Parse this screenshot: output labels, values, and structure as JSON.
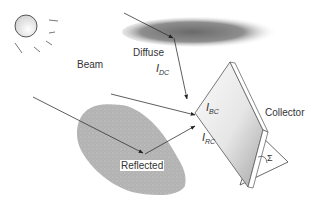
{
  "diagram": {
    "labels": {
      "diffuse": "Diffuse",
      "beam": "Beam",
      "reflected": "Reflected",
      "collector": "Collector",
      "i_dc_main": "I",
      "i_dc_sub": "DC",
      "i_bc_main": "I",
      "i_bc_sub": "BC",
      "i_rc_main": "I",
      "i_rc_sub": "RC",
      "tilt_angle": "Σ"
    },
    "elements": [
      "sun",
      "cloud",
      "ground-reflector",
      "collector-panel",
      "beam-ray",
      "diffuse-ray",
      "reflected-ray",
      "tilt-angle-arc"
    ],
    "colors": {
      "line": "#333333",
      "cloud": "#8a8a8a",
      "ground": "#b5b5b5",
      "panel_light": "#f4f4f4",
      "panel_dark": "#b8b8b8"
    }
  }
}
